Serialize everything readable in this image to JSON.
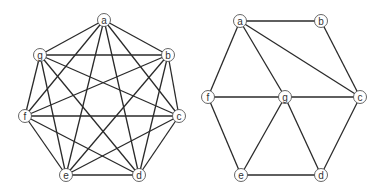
{
  "graphs": [
    {
      "name": "left-graph-complete-k7",
      "nodes": [
        {
          "id": "a",
          "label": "a",
          "x": 104,
          "y": 20
        },
        {
          "id": "b",
          "label": "b",
          "x": 168,
          "y": 55
        },
        {
          "id": "c",
          "label": "c",
          "x": 179,
          "y": 116
        },
        {
          "id": "d",
          "label": "d",
          "x": 139,
          "y": 175
        },
        {
          "id": "e",
          "label": "e",
          "x": 66,
          "y": 175
        },
        {
          "id": "f",
          "label": "f",
          "x": 25,
          "y": 116
        },
        {
          "id": "g",
          "label": "g",
          "x": 40,
          "y": 55
        }
      ],
      "edges": [
        [
          "a",
          "b"
        ],
        [
          "a",
          "c"
        ],
        [
          "a",
          "d"
        ],
        [
          "a",
          "e"
        ],
        [
          "a",
          "f"
        ],
        [
          "a",
          "g"
        ],
        [
          "b",
          "c"
        ],
        [
          "b",
          "d"
        ],
        [
          "b",
          "e"
        ],
        [
          "b",
          "f"
        ],
        [
          "b",
          "g"
        ],
        [
          "c",
          "d"
        ],
        [
          "c",
          "e"
        ],
        [
          "c",
          "f"
        ],
        [
          "c",
          "g"
        ],
        [
          "d",
          "e"
        ],
        [
          "d",
          "f"
        ],
        [
          "d",
          "g"
        ],
        [
          "e",
          "f"
        ],
        [
          "e",
          "g"
        ],
        [
          "f",
          "g"
        ]
      ]
    },
    {
      "name": "right-graph",
      "nodes": [
        {
          "id": "a",
          "label": "a",
          "x": 240,
          "y": 21
        },
        {
          "id": "b",
          "label": "b",
          "x": 321,
          "y": 21
        },
        {
          "id": "c",
          "label": "c",
          "x": 360,
          "y": 97
        },
        {
          "id": "d",
          "label": "d",
          "x": 321,
          "y": 175
        },
        {
          "id": "e",
          "label": "e",
          "x": 241,
          "y": 175
        },
        {
          "id": "f",
          "label": "f",
          "x": 208,
          "y": 97
        },
        {
          "id": "g",
          "label": "g",
          "x": 285,
          "y": 97
        }
      ],
      "edges": [
        [
          "a",
          "b"
        ],
        [
          "a",
          "c"
        ],
        [
          "a",
          "f"
        ],
        [
          "a",
          "g"
        ],
        [
          "b",
          "c"
        ],
        [
          "f",
          "g"
        ],
        [
          "g",
          "c"
        ],
        [
          "f",
          "e"
        ],
        [
          "g",
          "e"
        ],
        [
          "g",
          "d"
        ],
        [
          "c",
          "d"
        ],
        [
          "e",
          "d"
        ]
      ]
    }
  ],
  "style": {
    "edge_color": "#2a2a2a",
    "node_fill": "#ffffff",
    "node_stroke": "#555555",
    "node_radius": 6.5
  }
}
